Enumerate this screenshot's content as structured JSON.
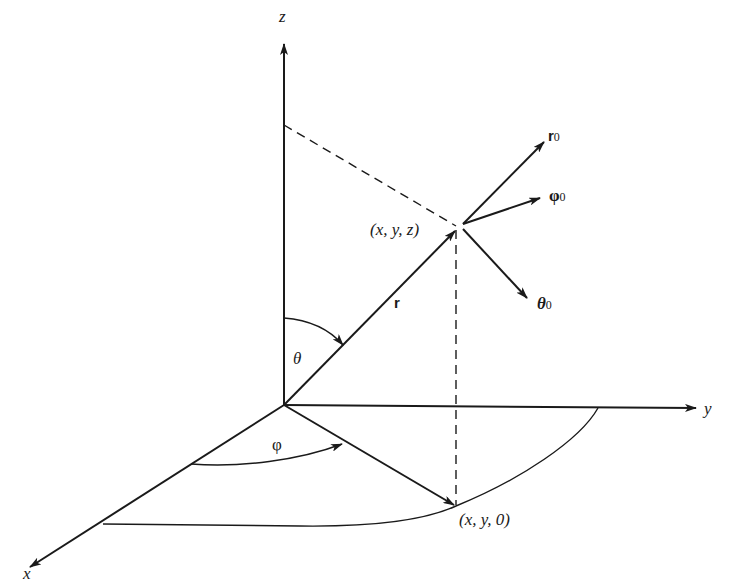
{
  "diagram": {
    "axes": {
      "x_label": "x",
      "y_label": "y",
      "z_label": "z"
    },
    "points": {
      "point_label": "(x, y, z)",
      "projection_label": "(x, y, 0)"
    },
    "vectors": {
      "position_label": "r",
      "r0_main": "r",
      "r0_sub": "0",
      "phi0_main": "φ",
      "phi0_sub": "0",
      "theta0_main": "θ",
      "theta0_sub": "0"
    },
    "angles": {
      "theta_label": "θ",
      "phi_label": "φ"
    },
    "colors": {
      "stroke": "#1a1a1a",
      "background": "#ffffff"
    }
  }
}
